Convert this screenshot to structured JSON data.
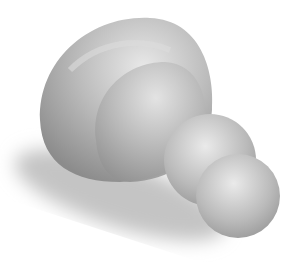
{
  "image": {
    "description": "Grayscale 3D rendering of a smooth blob-like object: a large domed segmented body with two smaller spheres attached at lower right, casting a soft shadow to the lower left",
    "colors": {
      "background": "#ffffff",
      "body_light": "#e6e6e6",
      "body_mid": "#b8b8b8",
      "body_dark": "#8a8a8a",
      "shadow": "#bdbdbd"
    }
  }
}
